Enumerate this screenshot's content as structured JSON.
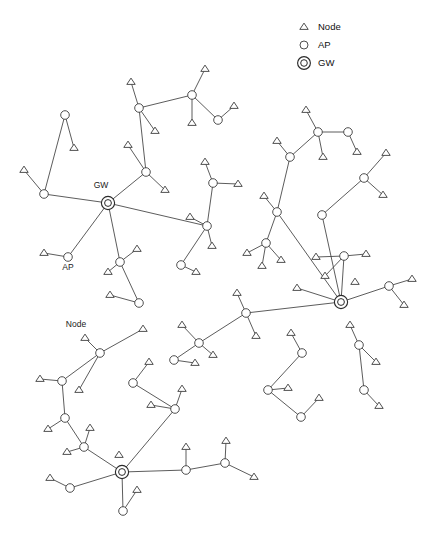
{
  "figure": {
    "width": 437,
    "height": 538,
    "background": "#ffffff",
    "line_color": "#4a4a4a",
    "marker_color": "#3c3c3c"
  },
  "legend": {
    "position": "top-right",
    "entries": [
      {
        "symbol": "triangle-up",
        "label": "Node",
        "icon_name": "node-triangle-icon",
        "x": 304,
        "y": 27,
        "text_x": 318,
        "text_y": 27
      },
      {
        "symbol": "circle",
        "label": "AP",
        "icon_name": "ap-circle-icon",
        "x": 304,
        "y": 45,
        "text_x": 318,
        "text_y": 45
      },
      {
        "symbol": "double-circle",
        "label": "GW",
        "icon_name": "gw-bullseye-icon",
        "x": 304,
        "y": 63,
        "text_x": 318,
        "text_y": 63
      }
    ]
  },
  "annotations": [
    {
      "text": "GW",
      "x": 101,
      "y": 186,
      "name": "gw-callout-label"
    },
    {
      "text": "AP",
      "x": 68,
      "y": 268,
      "name": "ap-callout-label"
    },
    {
      "text": "Node",
      "x": 76,
      "y": 325,
      "name": "node-callout-label"
    }
  ],
  "chart_data": {
    "type": "scatter",
    "title": "",
    "xlabel": "",
    "ylabel": "",
    "grid": false,
    "legend_position": "top-right",
    "node_types": [
      "Node",
      "AP",
      "GW"
    ],
    "counts": {
      "Node": 62,
      "AP": 38,
      "GW": 3
    },
    "nodes": [
      {
        "id": "gw1",
        "type": "GW",
        "x": 108,
        "y": 203
      },
      {
        "id": "gw2",
        "type": "GW",
        "x": 341,
        "y": 302
      },
      {
        "id": "gw3",
        "type": "GW",
        "x": 122,
        "y": 472
      },
      {
        "id": "a01",
        "type": "AP",
        "x": 65,
        "y": 115
      },
      {
        "id": "n01",
        "type": "Node",
        "x": 74,
        "y": 148
      },
      {
        "id": "a02",
        "type": "AP",
        "x": 44,
        "y": 194
      },
      {
        "id": "n02",
        "type": "Node",
        "x": 24,
        "y": 170
      },
      {
        "id": "a03",
        "type": "AP",
        "x": 139,
        "y": 108
      },
      {
        "id": "n03",
        "type": "Node",
        "x": 131,
        "y": 82
      },
      {
        "id": "n04",
        "type": "Node",
        "x": 155,
        "y": 131
      },
      {
        "id": "a04",
        "type": "AP",
        "x": 192,
        "y": 95
      },
      {
        "id": "n05",
        "type": "Node",
        "x": 205,
        "y": 69
      },
      {
        "id": "n06",
        "type": "Node",
        "x": 192,
        "y": 123
      },
      {
        "id": "a05",
        "type": "AP",
        "x": 218,
        "y": 120
      },
      {
        "id": "n07",
        "type": "Node",
        "x": 234,
        "y": 106
      },
      {
        "id": "a06",
        "type": "AP",
        "x": 146,
        "y": 172
      },
      {
        "id": "n08",
        "type": "Node",
        "x": 128,
        "y": 145
      },
      {
        "id": "n09",
        "type": "Node",
        "x": 165,
        "y": 190
      },
      {
        "id": "a07",
        "type": "AP",
        "x": 68,
        "y": 257
      },
      {
        "id": "n10",
        "type": "Node",
        "x": 44,
        "y": 253
      },
      {
        "id": "a08",
        "type": "AP",
        "x": 120,
        "y": 262
      },
      {
        "id": "n11",
        "type": "Node",
        "x": 137,
        "y": 249
      },
      {
        "id": "n12",
        "type": "Node",
        "x": 108,
        "y": 272
      },
      {
        "id": "a09",
        "type": "AP",
        "x": 139,
        "y": 303
      },
      {
        "id": "n13",
        "type": "Node",
        "x": 110,
        "y": 295
      },
      {
        "id": "a10",
        "type": "AP",
        "x": 181,
        "y": 265
      },
      {
        "id": "n14",
        "type": "Node",
        "x": 196,
        "y": 272
      },
      {
        "id": "a11",
        "type": "AP",
        "x": 213,
        "y": 183
      },
      {
        "id": "n15",
        "type": "Node",
        "x": 238,
        "y": 184
      },
      {
        "id": "n16",
        "type": "Node",
        "x": 205,
        "y": 162
      },
      {
        "id": "a12",
        "type": "AP",
        "x": 207,
        "y": 226
      },
      {
        "id": "n17",
        "type": "Node",
        "x": 190,
        "y": 217
      },
      {
        "id": "n18",
        "type": "Node",
        "x": 212,
        "y": 246
      },
      {
        "id": "a13",
        "type": "AP",
        "x": 318,
        "y": 132
      },
      {
        "id": "n19",
        "type": "Node",
        "x": 306,
        "y": 110
      },
      {
        "id": "n20",
        "type": "Node",
        "x": 323,
        "y": 157
      },
      {
        "id": "a14",
        "type": "AP",
        "x": 348,
        "y": 132
      },
      {
        "id": "n21",
        "type": "Node",
        "x": 357,
        "y": 152
      },
      {
        "id": "a15",
        "type": "AP",
        "x": 290,
        "y": 157
      },
      {
        "id": "n22",
        "type": "Node",
        "x": 277,
        "y": 141
      },
      {
        "id": "a16",
        "type": "AP",
        "x": 277,
        "y": 212
      },
      {
        "id": "n23",
        "type": "Node",
        "x": 264,
        "y": 196
      },
      {
        "id": "a17",
        "type": "AP",
        "x": 266,
        "y": 243
      },
      {
        "id": "n24",
        "type": "Node",
        "x": 247,
        "y": 253
      },
      {
        "id": "n25",
        "type": "Node",
        "x": 262,
        "y": 266
      },
      {
        "id": "n26",
        "type": "Node",
        "x": 281,
        "y": 260
      },
      {
        "id": "a18",
        "type": "AP",
        "x": 322,
        "y": 215
      },
      {
        "id": "a19",
        "type": "AP",
        "x": 364,
        "y": 178
      },
      {
        "id": "n27",
        "type": "Node",
        "x": 386,
        "y": 153
      },
      {
        "id": "n28",
        "type": "Node",
        "x": 383,
        "y": 195
      },
      {
        "id": "a20",
        "type": "AP",
        "x": 344,
        "y": 256
      },
      {
        "id": "n29",
        "type": "Node",
        "x": 366,
        "y": 254
      },
      {
        "id": "n30",
        "type": "Node",
        "x": 325,
        "y": 276
      },
      {
        "id": "n31",
        "type": "Node",
        "x": 316,
        "y": 257
      },
      {
        "id": "a21",
        "type": "AP",
        "x": 389,
        "y": 286
      },
      {
        "id": "n32",
        "type": "Node",
        "x": 412,
        "y": 279
      },
      {
        "id": "n33",
        "type": "Node",
        "x": 404,
        "y": 305
      },
      {
        "id": "a22",
        "type": "AP",
        "x": 246,
        "y": 313
      },
      {
        "id": "n34",
        "type": "Node",
        "x": 237,
        "y": 293
      },
      {
        "id": "n35",
        "type": "Node",
        "x": 256,
        "y": 336
      },
      {
        "id": "a23",
        "type": "AP",
        "x": 199,
        "y": 343
      },
      {
        "id": "n36",
        "type": "Node",
        "x": 182,
        "y": 325
      },
      {
        "id": "n37",
        "type": "Node",
        "x": 213,
        "y": 355
      },
      {
        "id": "a24",
        "type": "AP",
        "x": 174,
        "y": 360
      },
      {
        "id": "n38",
        "type": "Node",
        "x": 195,
        "y": 363
      },
      {
        "id": "a25",
        "type": "AP",
        "x": 302,
        "y": 353
      },
      {
        "id": "n39",
        "type": "Node",
        "x": 291,
        "y": 333
      },
      {
        "id": "a26",
        "type": "AP",
        "x": 268,
        "y": 390
      },
      {
        "id": "n40",
        "type": "Node",
        "x": 288,
        "y": 388
      },
      {
        "id": "a27",
        "type": "AP",
        "x": 301,
        "y": 417
      },
      {
        "id": "n41",
        "type": "Node",
        "x": 319,
        "y": 398
      },
      {
        "id": "a28",
        "type": "AP",
        "x": 359,
        "y": 345
      },
      {
        "id": "n42",
        "type": "Node",
        "x": 376,
        "y": 362
      },
      {
        "id": "a29",
        "type": "AP",
        "x": 364,
        "y": 390
      },
      {
        "id": "n43",
        "type": "Node",
        "x": 379,
        "y": 406
      },
      {
        "id": "n44",
        "type": "Node",
        "x": 350,
        "y": 325
      },
      {
        "id": "a30",
        "type": "AP",
        "x": 100,
        "y": 353
      },
      {
        "id": "n45",
        "type": "Node",
        "x": 85,
        "y": 338
      },
      {
        "id": "a31",
        "type": "AP",
        "x": 62,
        "y": 381
      },
      {
        "id": "n46",
        "type": "Node",
        "x": 40,
        "y": 379
      },
      {
        "id": "n47",
        "type": "Node",
        "x": 79,
        "y": 390
      },
      {
        "id": "a32",
        "type": "AP",
        "x": 65,
        "y": 418
      },
      {
        "id": "n48",
        "type": "Node",
        "x": 48,
        "y": 429
      },
      {
        "id": "a33",
        "type": "AP",
        "x": 84,
        "y": 447
      },
      {
        "id": "n49",
        "type": "Node",
        "x": 67,
        "y": 452
      },
      {
        "id": "n50",
        "type": "Node",
        "x": 90,
        "y": 428
      },
      {
        "id": "a34",
        "type": "AP",
        "x": 70,
        "y": 488
      },
      {
        "id": "n51",
        "type": "Node",
        "x": 50,
        "y": 478
      },
      {
        "id": "a35",
        "type": "AP",
        "x": 123,
        "y": 511
      },
      {
        "id": "n52",
        "type": "Node",
        "x": 137,
        "y": 490
      },
      {
        "id": "a36",
        "type": "AP",
        "x": 133,
        "y": 383
      },
      {
        "id": "n53",
        "type": "Node",
        "x": 149,
        "y": 362
      },
      {
        "id": "a37",
        "type": "AP",
        "x": 175,
        "y": 409
      },
      {
        "id": "n54",
        "type": "Node",
        "x": 182,
        "y": 389
      },
      {
        "id": "n55",
        "type": "Node",
        "x": 151,
        "y": 405
      },
      {
        "id": "a38",
        "type": "AP",
        "x": 186,
        "y": 470
      },
      {
        "id": "n56",
        "type": "Node",
        "x": 186,
        "y": 447
      },
      {
        "id": "a39",
        "type": "AP",
        "x": 225,
        "y": 463
      },
      {
        "id": "n57",
        "type": "Node",
        "x": 226,
        "y": 441
      },
      {
        "id": "n58",
        "type": "Node",
        "x": 254,
        "y": 477
      },
      {
        "id": "n59",
        "type": "Node",
        "x": 119,
        "y": 455
      },
      {
        "id": "n60",
        "type": "Node",
        "x": 143,
        "y": 329
      },
      {
        "id": "n61",
        "type": "Node",
        "x": 297,
        "y": 288
      },
      {
        "id": "n62",
        "type": "Node",
        "x": 355,
        "y": 282
      }
    ],
    "edges": [
      [
        "gw1",
        "a02"
      ],
      [
        "gw1",
        "a06"
      ],
      [
        "gw1",
        "a07"
      ],
      [
        "gw1",
        "a08"
      ],
      [
        "gw1",
        "a12"
      ],
      [
        "a02",
        "a01"
      ],
      [
        "a01",
        "n01"
      ],
      [
        "a02",
        "n02"
      ],
      [
        "a06",
        "a03"
      ],
      [
        "a06",
        "n08"
      ],
      [
        "a06",
        "n09"
      ],
      [
        "a03",
        "n03"
      ],
      [
        "a03",
        "n04"
      ],
      [
        "a03",
        "a04"
      ],
      [
        "a04",
        "n05"
      ],
      [
        "a04",
        "n06"
      ],
      [
        "a04",
        "a05"
      ],
      [
        "a05",
        "n07"
      ],
      [
        "a07",
        "n10"
      ],
      [
        "a08",
        "n11"
      ],
      [
        "a08",
        "n12"
      ],
      [
        "a08",
        "a09"
      ],
      [
        "a09",
        "n13"
      ],
      [
        "a12",
        "a10"
      ],
      [
        "a12",
        "n17"
      ],
      [
        "a12",
        "n18"
      ],
      [
        "a12",
        "a11"
      ],
      [
        "a10",
        "n14"
      ],
      [
        "a11",
        "n15"
      ],
      [
        "a11",
        "n16"
      ],
      [
        "gw2",
        "a16"
      ],
      [
        "gw2",
        "a18"
      ],
      [
        "gw2",
        "a20"
      ],
      [
        "gw2",
        "a21"
      ],
      [
        "gw2",
        "a22"
      ],
      [
        "gw2",
        "n61"
      ],
      [
        "a16",
        "a15"
      ],
      [
        "a16",
        "n23"
      ],
      [
        "a16",
        "a17"
      ],
      [
        "a15",
        "a13"
      ],
      [
        "a15",
        "n22"
      ],
      [
        "a13",
        "n19"
      ],
      [
        "a13",
        "n20"
      ],
      [
        "a13",
        "a14"
      ],
      [
        "a14",
        "n21"
      ],
      [
        "a17",
        "n24"
      ],
      [
        "a17",
        "n25"
      ],
      [
        "a17",
        "n26"
      ],
      [
        "a18",
        "a19"
      ],
      [
        "a19",
        "n27"
      ],
      [
        "a19",
        "n28"
      ],
      [
        "a20",
        "n29"
      ],
      [
        "a20",
        "n30"
      ],
      [
        "a20",
        "n31"
      ],
      [
        "a21",
        "n32"
      ],
      [
        "a21",
        "n33"
      ],
      [
        "a22",
        "n34"
      ],
      [
        "a22",
        "n35"
      ],
      [
        "a22",
        "a23"
      ],
      [
        "a23",
        "n36"
      ],
      [
        "a23",
        "n37"
      ],
      [
        "a23",
        "a24"
      ],
      [
        "a24",
        "n38"
      ],
      [
        "a25",
        "n39"
      ],
      [
        "a25",
        "a26"
      ],
      [
        "a26",
        "n40"
      ],
      [
        "a26",
        "a27"
      ],
      [
        "a27",
        "n41"
      ],
      [
        "a28",
        "n42"
      ],
      [
        "a28",
        "n44"
      ],
      [
        "a28",
        "a29"
      ],
      [
        "a29",
        "n43"
      ],
      [
        "gw3",
        "a33"
      ],
      [
        "gw3",
        "a34"
      ],
      [
        "gw3",
        "a35"
      ],
      [
        "gw3",
        "a38"
      ],
      [
        "gw3",
        "a37"
      ],
      [
        "a30",
        "n45"
      ],
      [
        "a30",
        "n60"
      ],
      [
        "a30",
        "a31"
      ],
      [
        "a30",
        "n47"
      ],
      [
        "a31",
        "n46"
      ],
      [
        "a31",
        "a32"
      ],
      [
        "a32",
        "n48"
      ],
      [
        "a32",
        "a33"
      ],
      [
        "a33",
        "n49"
      ],
      [
        "a33",
        "n50"
      ],
      [
        "a34",
        "n51"
      ],
      [
        "a35",
        "n52"
      ],
      [
        "a36",
        "n53"
      ],
      [
        "a36",
        "a37"
      ],
      [
        "a37",
        "n54"
      ],
      [
        "a37",
        "n55"
      ],
      [
        "a38",
        "n56"
      ],
      [
        "a38",
        "a39"
      ],
      [
        "a39",
        "n57"
      ],
      [
        "a39",
        "n58"
      ]
    ]
  }
}
